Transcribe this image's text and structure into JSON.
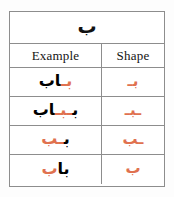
{
  "table": {
    "title_letter": "ب",
    "headers": {
      "example": "Example",
      "shape": "Shape"
    },
    "highlight_color": "#e0714f",
    "text_color": "#000000",
    "border_color": "#8d8d8d",
    "rows": [
      {
        "position": "initial",
        "example_prefix": "",
        "example_highlight": "بـ",
        "example_suffix": "اب",
        "example_full": "باب",
        "shape": "بـ"
      },
      {
        "position": "medial",
        "example_prefix": "ب",
        "example_highlight": "ـبـ",
        "example_suffix": "اب",
        "example_full": "بـبـاب",
        "shape": "ـبـ"
      },
      {
        "position": "final-connected",
        "example_prefix": "ب",
        "example_highlight": "ـب",
        "example_suffix": "",
        "example_full": "بـب",
        "shape": "ـب"
      },
      {
        "position": "isolated",
        "example_prefix": "با",
        "example_highlight": "ب",
        "example_suffix": "",
        "example_full": "باب",
        "shape": "ب"
      }
    ]
  }
}
